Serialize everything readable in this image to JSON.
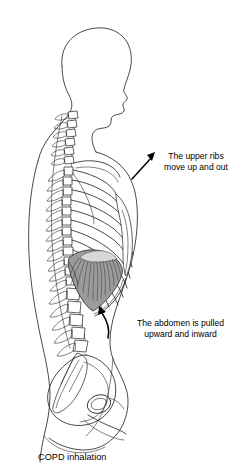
{
  "figure": {
    "kind": "anatomical-side-view-illustration",
    "caption": "COPD inhalation",
    "orientation": "facing right",
    "ink_color": "#1a1a1a",
    "background_color": "#ffffff",
    "diaphragm_fill_color": "#9b9b9b",
    "central_tendon_color": "#d8d8d8",
    "parts": [
      {
        "name": "head-profile",
        "label": "head"
      },
      {
        "name": "cervical-spine",
        "label": "cervical vertebrae"
      },
      {
        "name": "thoracic-spine",
        "label": "thoracic vertebrae"
      },
      {
        "name": "lumbar-spine",
        "label": "lumbar vertebrae"
      },
      {
        "name": "sacrum",
        "label": "sacrum"
      },
      {
        "name": "ribcage",
        "label": "ribs"
      },
      {
        "name": "sternum",
        "label": "sternum"
      },
      {
        "name": "clavicle-scapula",
        "label": "shoulder girdle"
      },
      {
        "name": "diaphragm",
        "label": "diaphragm"
      },
      {
        "name": "pelvis",
        "label": "pelvis"
      },
      {
        "name": "body-outline",
        "label": "skin outline"
      }
    ]
  },
  "annotations": [
    {
      "name": "upper-ribs-annotation",
      "line1": "The upper ribs",
      "line2": "move up and out",
      "arrow": "straight-arrow-up-left",
      "points_to": "upper ribcage"
    },
    {
      "name": "abdomen-annotation",
      "line1": "The abdomen is pulled",
      "line2": "upward and inward",
      "arrow": "curved-arrow-up",
      "points_to": "abdomen below diaphragm"
    }
  ],
  "icons": {
    "straight_arrow": "arrow-up-left-icon",
    "curved_arrow": "arrow-curved-up-icon"
  }
}
